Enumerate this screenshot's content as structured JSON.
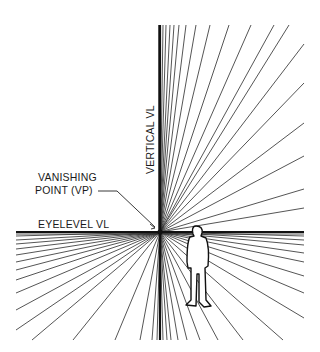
{
  "diagram": {
    "type": "one-point perspective construction",
    "background": "#ffffff",
    "ink_color": "#1a1a1a",
    "vanishing_point": {
      "x": 160,
      "y": 232
    },
    "frame": {
      "left": 16,
      "right": 304,
      "top": 25,
      "bottom": 340
    },
    "labels": {
      "vertical_vl": "VERTICAL VL",
      "vanishing_point_line1": "VANISHING",
      "vanishing_point_line2": "POINT (VP)",
      "eyelevel_vl": "EYELEVEL VL"
    },
    "rays": {
      "top_endpoints_x": [
        163,
        166,
        170,
        174,
        179,
        186,
        196,
        210,
        229,
        251,
        274,
        289
      ],
      "right_upper_endpoints_y": [
        44,
        83,
        123,
        156,
        189,
        208
      ],
      "left_endpoints_y": [
        236,
        240,
        244,
        249,
        255,
        262,
        270,
        280,
        293,
        310,
        330
      ],
      "bottom_left_endpoints_x": [
        32,
        73,
        115,
        140,
        152,
        157
      ],
      "bottom_right_endpoints_x": [
        163,
        167,
        171,
        178,
        187,
        200,
        218,
        243,
        283
      ],
      "right_lower_endpoints_y": [
        236,
        240,
        245,
        253,
        262,
        276,
        293,
        318
      ]
    },
    "figure": {
      "description": "standing human silhouette, white fill with black outline",
      "x_range": [
        185,
        212
      ],
      "y_range": [
        226,
        308
      ]
    }
  }
}
